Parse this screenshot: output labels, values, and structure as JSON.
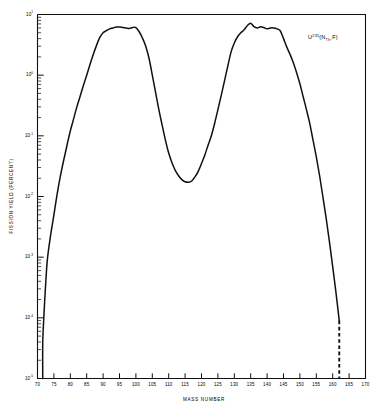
{
  "chart_data": {
    "type": "line",
    "title": "",
    "subtitle": "",
    "xlabel": "MASS NUMBER",
    "ylabel": "FISSION YIELD (PERCENT)",
    "xlim": [
      70,
      170
    ],
    "ylim": [
      1e-05,
      10
    ],
    "yscale": "log",
    "xscale": "linear",
    "grid": false,
    "legend_position": "none",
    "annotations": [
      {
        "text": "U235(NTh,F)",
        "base": "U",
        "superscript": "235",
        "paren_open": "(",
        "n_symbol": "N",
        "subscript": "Th",
        "tail": ",F)",
        "x": 152.5,
        "y": 3.9
      }
    ],
    "xticks": [
      70,
      75,
      80,
      85,
      90,
      95,
      100,
      105,
      110,
      115,
      120,
      125,
      130,
      135,
      140,
      145,
      150,
      155,
      160,
      165,
      170
    ],
    "xtick_labels": [
      "70",
      "75",
      "80",
      "85",
      "90",
      "95",
      "100",
      "105",
      "110",
      "115",
      "120",
      "125",
      "130",
      "135",
      "140",
      "145",
      "150",
      "155",
      "160",
      "165",
      "170"
    ],
    "yticks": [
      10,
      1,
      0.1,
      0.01,
      0.001,
      0.0001,
      1e-05
    ],
    "ytick_labels": [
      "10",
      "10",
      "10",
      "10",
      "10",
      "10",
      "10"
    ],
    "ytick_exponents": [
      "1",
      "0",
      "-1",
      "-2",
      "-3",
      "-4",
      "-5"
    ],
    "series": [
      {
        "name": "U-235 thermal neutron fission yield",
        "style": "solid",
        "x": [
          71.6,
          71.6,
          72.0,
          72.4,
          73.0,
          74.0,
          75.0,
          76.0,
          77.0,
          78.0,
          79.0,
          80.0,
          81.0,
          82.0,
          83.0,
          84.0,
          85.0,
          86.0,
          87.0,
          88.0,
          89.0,
          90.0,
          91.0,
          92.0,
          93.0,
          94.0,
          95.0,
          96.0,
          97.0,
          98.0,
          99.0,
          100.0,
          101.0,
          102.0,
          103.0,
          104.0,
          105.0,
          106.0,
          107.0,
          108.0,
          109.0,
          110.0,
          111.0,
          112.0,
          113.0,
          114.0,
          115.0,
          116.0,
          117.0,
          118.0,
          119.0,
          120.0,
          121.0,
          122.0,
          123.0,
          124.0,
          125.0,
          126.0,
          127.0,
          128.0,
          129.0,
          130.0,
          131.0,
          132.0,
          133.0,
          134.0,
          135.0,
          136.0,
          137.0,
          138.0,
          139.0,
          140.0,
          141.0,
          142.0,
          143.0,
          144.0,
          145.0,
          146.0,
          147.0,
          148.0,
          149.0,
          150.0,
          151.0,
          152.0,
          153.0,
          154.0,
          155.0,
          156.0,
          157.0,
          158.0,
          159.0,
          160.0,
          161.0,
          162.0
        ],
        "y": [
          1e-05,
          4e-05,
          0.00012,
          0.0003,
          0.0009,
          0.0023,
          0.005,
          0.011,
          0.022,
          0.04,
          0.07,
          0.12,
          0.19,
          0.3,
          0.45,
          0.68,
          1.0,
          1.5,
          2.2,
          3.1,
          4.2,
          5.0,
          5.4,
          5.8,
          6.0,
          6.2,
          6.2,
          6.1,
          6.0,
          5.9,
          6.1,
          6.1,
          5.2,
          4.1,
          3.0,
          1.9,
          1.0,
          0.52,
          0.27,
          0.15,
          0.085,
          0.052,
          0.036,
          0.027,
          0.022,
          0.019,
          0.0175,
          0.0172,
          0.018,
          0.021,
          0.026,
          0.035,
          0.048,
          0.07,
          0.1,
          0.16,
          0.27,
          0.46,
          0.8,
          1.4,
          2.4,
          3.4,
          4.3,
          5.0,
          5.6,
          6.6,
          7.2,
          6.3,
          6.0,
          6.3,
          6.1,
          5.8,
          6.0,
          6.0,
          5.8,
          5.4,
          4.0,
          2.9,
          2.2,
          1.6,
          1.1,
          0.72,
          0.44,
          0.27,
          0.16,
          0.085,
          0.045,
          0.022,
          0.01,
          0.0044,
          0.0018,
          0.0007,
          0.00026,
          9e-05
        ]
      },
      {
        "name": "extrapolated cutoff",
        "style": "dashed",
        "x": [
          162.0,
          162.0
        ],
        "y": [
          9e-05,
          1e-05
        ]
      },
      {
        "name": "low-mass cutoff",
        "style": "solid-vertical",
        "x": [
          71.6,
          71.6
        ],
        "y": [
          1e-05,
          1e-05
        ]
      }
    ]
  },
  "axes": {
    "x_axis_name": "mass-number-axis",
    "y_axis_name": "fission-yield-axis"
  }
}
